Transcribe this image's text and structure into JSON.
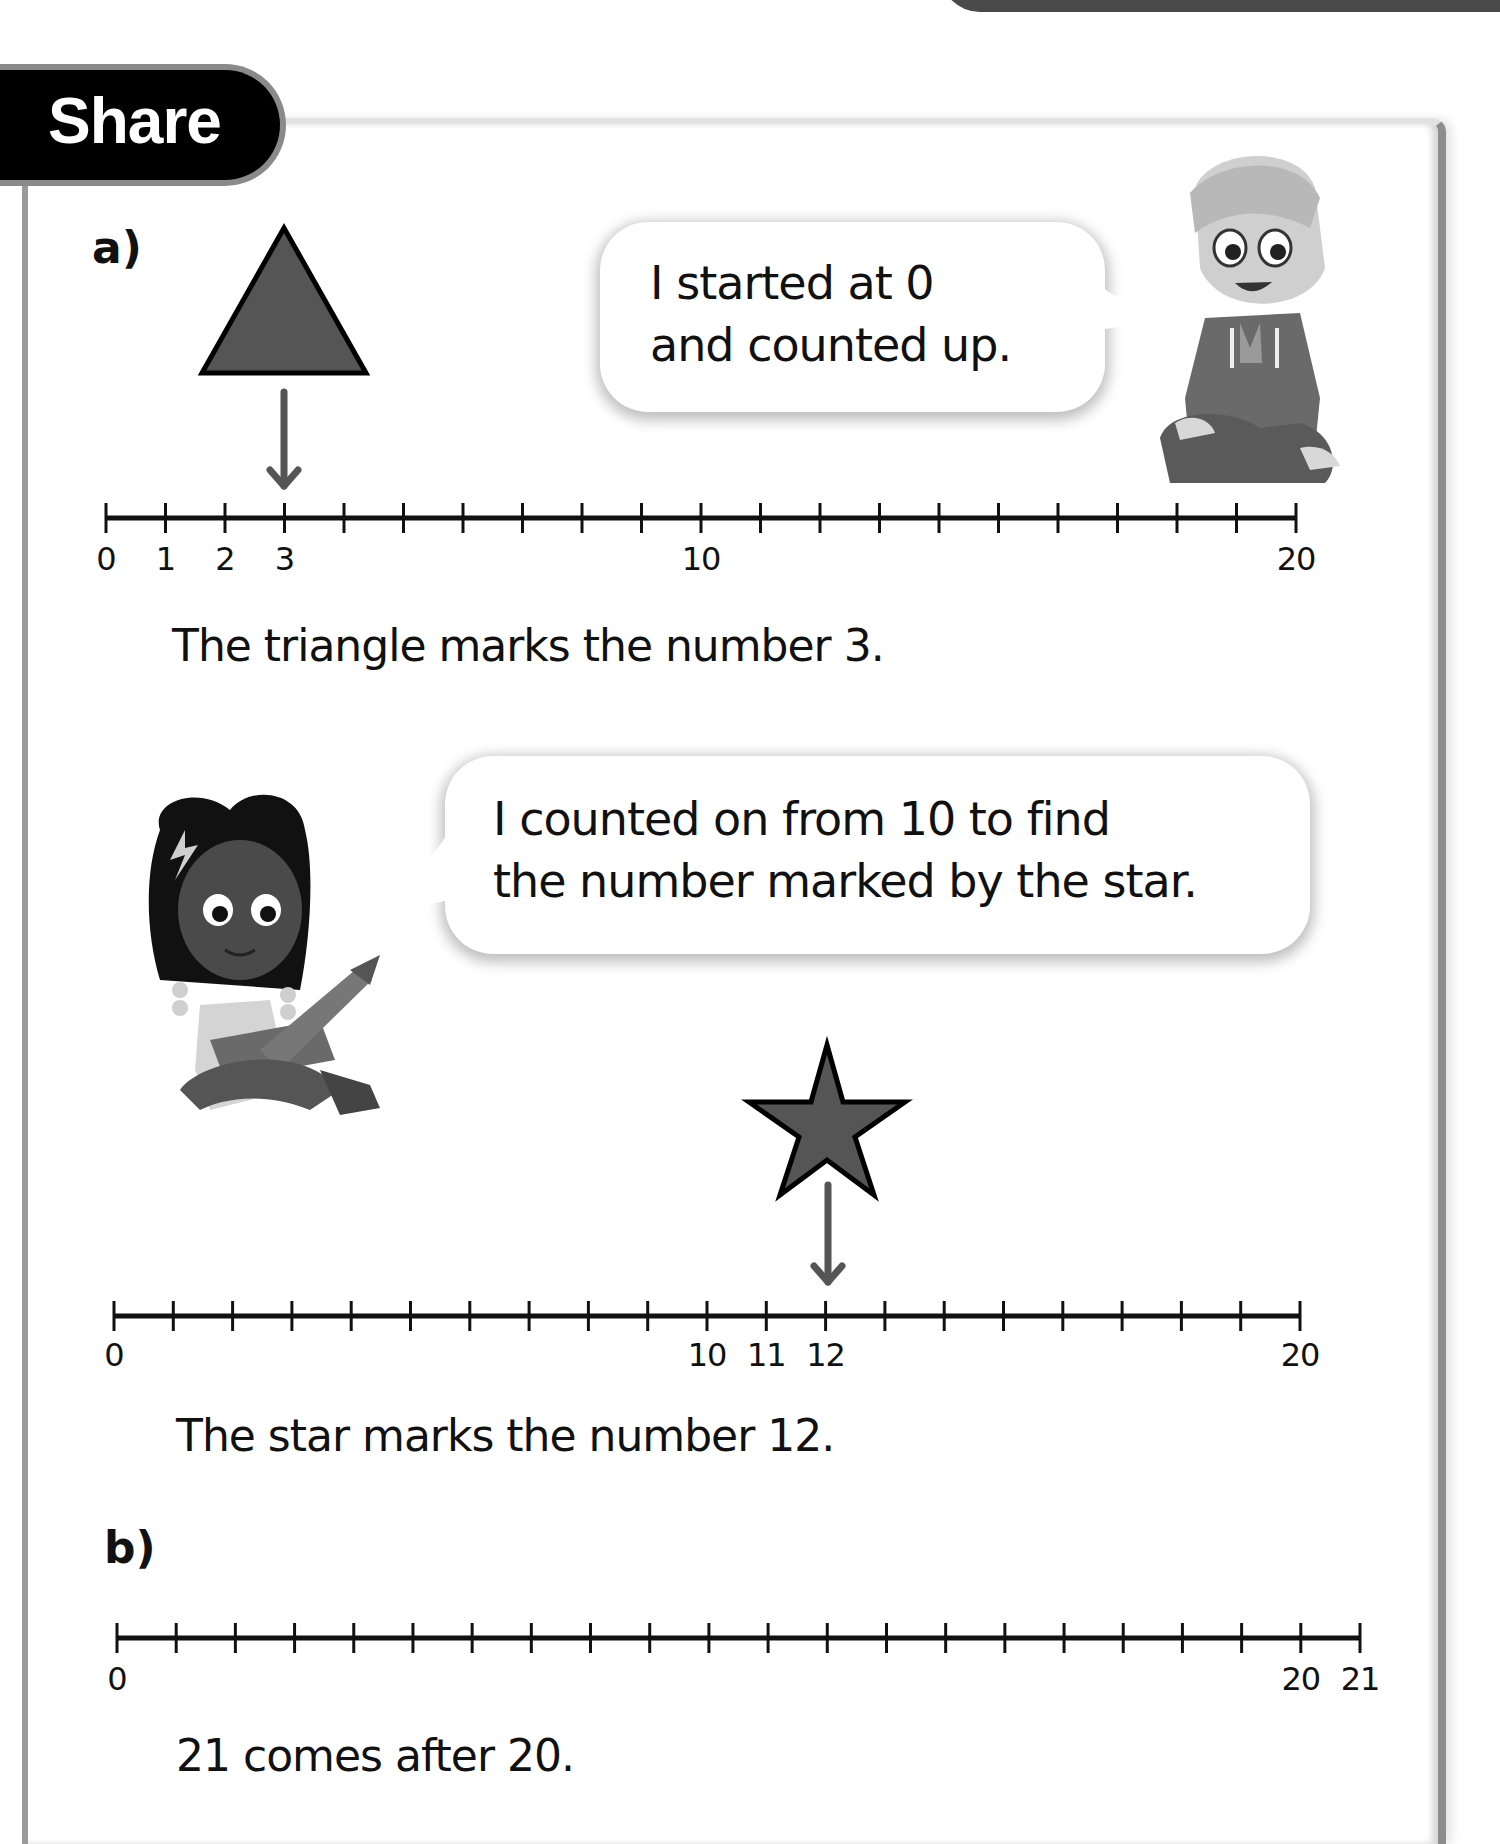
{
  "header": {
    "section_title": "Share"
  },
  "part_a": {
    "label": "a)",
    "speech_boy": [
      "I started at 0",
      "and counted up."
    ],
    "number_line_1": {
      "min": 0,
      "max": 20,
      "labels": [
        {
          "value": 0,
          "text": "0"
        },
        {
          "value": 1,
          "text": "1"
        },
        {
          "value": 2,
          "text": "2"
        },
        {
          "value": 3,
          "text": "3"
        },
        {
          "value": 10,
          "text": "10"
        },
        {
          "value": 20,
          "text": "20"
        }
      ],
      "marker": {
        "shape": "triangle",
        "value": 3
      }
    },
    "caption_1": "The triangle marks the number 3.",
    "speech_girl": [
      "I counted on from 10 to find",
      "the number marked by the star."
    ],
    "number_line_2": {
      "min": 0,
      "max": 20,
      "labels": [
        {
          "value": 0,
          "text": "0"
        },
        {
          "value": 10,
          "text": "10"
        },
        {
          "value": 11,
          "text": "11"
        },
        {
          "value": 12,
          "text": "12"
        },
        {
          "value": 20,
          "text": "20"
        }
      ],
      "marker": {
        "shape": "star",
        "value": 12
      }
    },
    "caption_2": "The star marks the number 12."
  },
  "part_b": {
    "label": "b)",
    "number_line_3": {
      "min": 0,
      "max": 21,
      "labels": [
        {
          "value": 0,
          "text": "0"
        },
        {
          "value": 20,
          "text": "20"
        },
        {
          "value": 21,
          "text": "21"
        }
      ]
    },
    "caption": "21 comes after 20."
  },
  "colors": {
    "badge_bg": "#000000",
    "shape_fill": "#555555",
    "arrow": "#555555",
    "line": "#111111"
  }
}
